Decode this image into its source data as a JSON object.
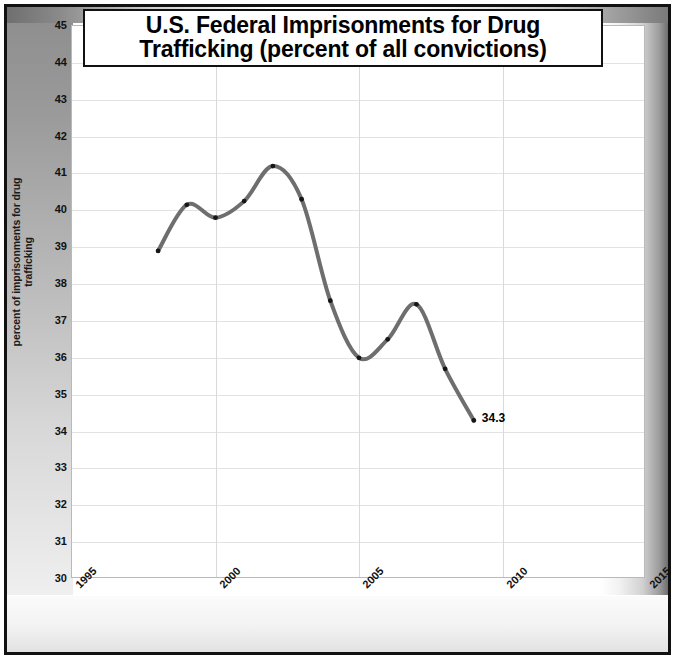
{
  "figure": {
    "title_line_1": "U.S. Federal Imprisonments for Drug",
    "title_line_2": "Trafficking (percent of all convictions)",
    "end_point_label": "34.3"
  },
  "axes": {
    "y_title": "percent of imprisonments for drug trafficking",
    "y_ticks": [
      "45",
      "44",
      "43",
      "42",
      "41",
      "40",
      "39",
      "38",
      "37",
      "36",
      "35",
      "34",
      "33",
      "32",
      "31",
      "30"
    ],
    "x_ticks": [
      "1995",
      "2000",
      "2005",
      "2010",
      "2015"
    ]
  },
  "chart_data": {
    "type": "line",
    "title": "U.S. Federal Imprisonments for Drug Trafficking (percent of all convictions)",
    "xlabel": "",
    "ylabel": "percent of imprisonments for drug trafficking",
    "xlim": [
      1995,
      2015
    ],
    "ylim": [
      30,
      45
    ],
    "grid": true,
    "legend": "none",
    "smoothing": "spline",
    "line_color": "#6e6e6e",
    "marker_color": "#161616",
    "x": [
      1998,
      1999,
      2000,
      2001,
      2002,
      2003,
      2004,
      2005,
      2006,
      2007,
      2008,
      2009
    ],
    "values": [
      38.9,
      40.15,
      39.8,
      40.25,
      41.2,
      40.3,
      37.55,
      36.0,
      36.5,
      37.45,
      35.7,
      34.3
    ],
    "annotations": [
      {
        "x": 2009,
        "y": 34.3,
        "text": "34.3"
      }
    ]
  }
}
